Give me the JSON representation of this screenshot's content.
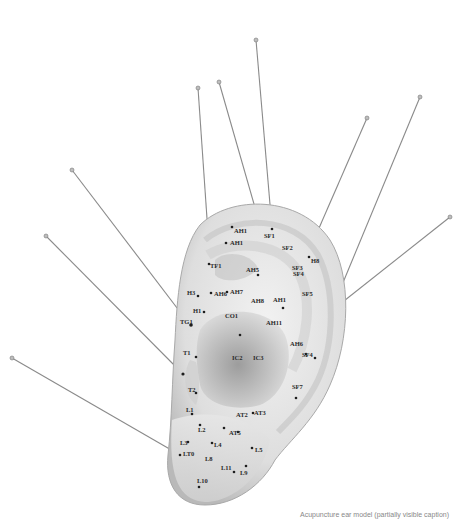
{
  "scene": {
    "subject": "Acupuncture ear model with needles",
    "background_color": "#ffffff",
    "model_color": "#e4e4e4",
    "needle_color": "#8a8a8a"
  },
  "labels": [
    {
      "text": "AH1",
      "x": 234,
      "y": 233
    },
    {
      "text": "AH1",
      "x": 230,
      "y": 245
    },
    {
      "text": "SF1",
      "x": 264,
      "y": 238
    },
    {
      "text": "SF2",
      "x": 282,
      "y": 250
    },
    {
      "text": "SF3",
      "x": 292,
      "y": 270
    },
    {
      "text": "H8",
      "x": 311,
      "y": 263
    },
    {
      "text": "TF1",
      "x": 210,
      "y": 268
    },
    {
      "text": "AH5",
      "x": 246,
      "y": 272
    },
    {
      "text": "SF4",
      "x": 293,
      "y": 276
    },
    {
      "text": "AH1",
      "x": 273,
      "y": 302
    },
    {
      "text": "SF5",
      "x": 302,
      "y": 296
    },
    {
      "text": "H3",
      "x": 187,
      "y": 295
    },
    {
      "text": "AH6",
      "x": 214,
      "y": 296
    },
    {
      "text": "AH7",
      "x": 230,
      "y": 294
    },
    {
      "text": "AH8",
      "x": 251,
      "y": 303
    },
    {
      "text": "H1",
      "x": 193,
      "y": 313
    },
    {
      "text": "TG1",
      "x": 180,
      "y": 324
    },
    {
      "text": "CO1",
      "x": 225,
      "y": 318
    },
    {
      "text": "AH11",
      "x": 266,
      "y": 325
    },
    {
      "text": "AH6",
      "x": 290,
      "y": 346
    },
    {
      "text": "SF4",
      "x": 302,
      "y": 357
    },
    {
      "text": "T1",
      "x": 183,
      "y": 355
    },
    {
      "text": "IC2",
      "x": 232,
      "y": 360
    },
    {
      "text": "IC3",
      "x": 253,
      "y": 360
    },
    {
      "text": "T2",
      "x": 188,
      "y": 392
    },
    {
      "text": "SF7",
      "x": 292,
      "y": 389
    },
    {
      "text": "L1",
      "x": 186,
      "y": 412
    },
    {
      "text": "AT2",
      "x": 236,
      "y": 417
    },
    {
      "text": "AT3",
      "x": 254,
      "y": 415
    },
    {
      "text": "L2",
      "x": 198,
      "y": 432
    },
    {
      "text": "AT5",
      "x": 229,
      "y": 435
    },
    {
      "text": "L3",
      "x": 180,
      "y": 445
    },
    {
      "text": "L4",
      "x": 214,
      "y": 447
    },
    {
      "text": "L5",
      "x": 255,
      "y": 452
    },
    {
      "text": "LT0",
      "x": 183,
      "y": 456
    },
    {
      "text": "L8",
      "x": 205,
      "y": 461
    },
    {
      "text": "L11",
      "x": 221,
      "y": 470
    },
    {
      "text": "L9",
      "x": 240,
      "y": 475
    },
    {
      "text": "L10",
      "x": 197,
      "y": 483
    }
  ],
  "caption": {
    "text": "Acupuncture ear model (partially visible caption)"
  }
}
